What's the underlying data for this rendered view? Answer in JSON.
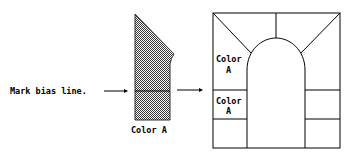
{
  "diagram": {
    "left_label": "Mark bias line.",
    "piece_label": "Color A",
    "panel_upper_label_line1": "Color",
    "panel_upper_label_line2": "A",
    "panel_lower_label_line1": "Color",
    "panel_lower_label_line2": "A",
    "colors": {
      "stroke": "#000000",
      "fill_pattern": "#555555",
      "background": "#ffffff"
    }
  }
}
